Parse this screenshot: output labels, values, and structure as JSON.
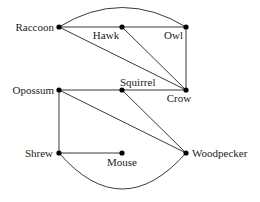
{
  "diagram": {
    "type": "undirected-graph",
    "nodes": [
      {
        "id": "raccoon",
        "label": "Raccoon",
        "x": 59,
        "y": 27
      },
      {
        "id": "hawk",
        "label": "Hawk",
        "x": 122,
        "y": 27
      },
      {
        "id": "owl",
        "label": "Owl",
        "x": 186,
        "y": 27
      },
      {
        "id": "opossum",
        "label": "Opossum",
        "x": 59,
        "y": 90
      },
      {
        "id": "squirrel",
        "label": "Squirrel",
        "x": 122,
        "y": 90
      },
      {
        "id": "crow",
        "label": "Crow",
        "x": 186,
        "y": 90
      },
      {
        "id": "shrew",
        "label": "Shrew",
        "x": 59,
        "y": 153
      },
      {
        "id": "mouse",
        "label": "Mouse",
        "x": 122,
        "y": 153
      },
      {
        "id": "woodpecker",
        "label": "Woodpecker",
        "x": 186,
        "y": 153
      }
    ],
    "edges": [
      [
        "raccoon",
        "hawk"
      ],
      [
        "hawk",
        "owl"
      ],
      [
        "raccoon",
        "owl"
      ],
      [
        "raccoon",
        "crow"
      ],
      [
        "hawk",
        "crow"
      ],
      [
        "owl",
        "crow"
      ],
      [
        "opossum",
        "squirrel"
      ],
      [
        "squirrel",
        "crow"
      ],
      [
        "opossum",
        "woodpecker"
      ],
      [
        "squirrel",
        "woodpecker"
      ],
      [
        "opossum",
        "shrew"
      ],
      [
        "shrew",
        "mouse"
      ],
      [
        "shrew",
        "woodpecker"
      ]
    ],
    "colors": {
      "edge": "#3a3a3a",
      "node": "#000000",
      "label": "#222222",
      "background": "#ffffff"
    }
  }
}
